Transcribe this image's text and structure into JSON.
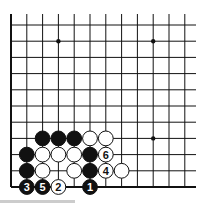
{
  "diagram": {
    "type": "go-board-fragment",
    "columns": 12,
    "rows": 11,
    "edges": [
      "left",
      "bottom"
    ],
    "star_points": [
      [
        3,
        1
      ],
      [
        9,
        1
      ],
      [
        9,
        7
      ]
    ],
    "stones": [
      {
        "col": 2,
        "row": 7,
        "color": "black",
        "label": ""
      },
      {
        "col": 3,
        "row": 7,
        "color": "black",
        "label": ""
      },
      {
        "col": 4,
        "row": 7,
        "color": "black",
        "label": ""
      },
      {
        "col": 5,
        "row": 7,
        "color": "white",
        "label": ""
      },
      {
        "col": 6,
        "row": 7,
        "color": "white",
        "label": ""
      },
      {
        "col": 1,
        "row": 8,
        "color": "black",
        "label": ""
      },
      {
        "col": 2,
        "row": 8,
        "color": "white",
        "label": ""
      },
      {
        "col": 3,
        "row": 8,
        "color": "white",
        "label": ""
      },
      {
        "col": 4,
        "row": 8,
        "color": "white",
        "label": ""
      },
      {
        "col": 5,
        "row": 8,
        "color": "black",
        "label": ""
      },
      {
        "col": 6,
        "row": 8,
        "color": "white",
        "label": "6"
      },
      {
        "col": 1,
        "row": 9,
        "color": "black",
        "label": ""
      },
      {
        "col": 2,
        "row": 9,
        "color": "white",
        "label": ""
      },
      {
        "col": 4,
        "row": 9,
        "color": "white",
        "label": ""
      },
      {
        "col": 5,
        "row": 9,
        "color": "black",
        "label": ""
      },
      {
        "col": 6,
        "row": 9,
        "color": "white",
        "label": "4"
      },
      {
        "col": 7,
        "row": 9,
        "color": "white",
        "label": ""
      },
      {
        "col": 1,
        "row": 10,
        "color": "black",
        "label": "3"
      },
      {
        "col": 2,
        "row": 10,
        "color": "black",
        "label": "5"
      },
      {
        "col": 3,
        "row": 10,
        "color": "white",
        "label": "2"
      },
      {
        "col": 5,
        "row": 10,
        "color": "black",
        "label": "1"
      }
    ]
  }
}
